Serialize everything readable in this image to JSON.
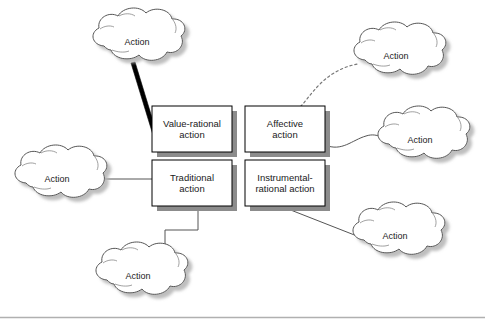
{
  "figure": {
    "boxes": [
      {
        "id": "value-rational",
        "label": "Value-rational\naction",
        "x": 152,
        "y": 106,
        "w": 80,
        "h": 46
      },
      {
        "id": "affective",
        "label": "Affective\naction",
        "x": 245,
        "y": 106,
        "w": 80,
        "h": 46
      },
      {
        "id": "traditional",
        "label": "Traditional\naction",
        "x": 152,
        "y": 160,
        "w": 80,
        "h": 46
      },
      {
        "id": "instrumental-rational",
        "label": "Instrumental-\nrational action",
        "x": 245,
        "y": 160,
        "w": 80,
        "h": 46
      }
    ],
    "clouds": [
      {
        "id": "cloud-top-left",
        "label": "Action",
        "cx": 137,
        "cy": 42,
        "rx": 48,
        "ry": 26
      },
      {
        "id": "cloud-top-right",
        "label": "Action",
        "cx": 396,
        "cy": 56,
        "rx": 46,
        "ry": 25
      },
      {
        "id": "cloud-right-middle",
        "label": "Action",
        "cx": 420,
        "cy": 140,
        "rx": 46,
        "ry": 25
      },
      {
        "id": "cloud-right-bottom",
        "label": "Action",
        "cx": 395,
        "cy": 236,
        "rx": 46,
        "ry": 25
      },
      {
        "id": "cloud-left",
        "label": "Action",
        "cx": 57,
        "cy": 179,
        "rx": 46,
        "ry": 25
      },
      {
        "id": "cloud-bottom",
        "label": "Action",
        "cx": 138,
        "cy": 276,
        "rx": 46,
        "ry": 25
      }
    ],
    "connectors": [
      {
        "id": "connector-top-left-to-value-rational",
        "style": "thick-tapered"
      },
      {
        "id": "connector-affective-to-top-right",
        "style": "dotted-curve"
      },
      {
        "id": "connector-affective-to-right-middle",
        "style": "thin-curve"
      },
      {
        "id": "connector-instrumental-to-right-bottom",
        "style": "thin-line"
      },
      {
        "id": "connector-left-to-traditional",
        "style": "thin-line"
      },
      {
        "id": "connector-traditional-to-bottom",
        "style": "orthogonal-step"
      }
    ],
    "colors": {
      "box_fill": "#ffffff",
      "box_border": "#000000",
      "shadow": "#808080",
      "cloud_fill": "#ffffff",
      "cloud_border": "#555555",
      "line": "#555555",
      "thick_line": "#000000",
      "text": "#1a1a1a",
      "rule": "#b0b0b0"
    }
  }
}
